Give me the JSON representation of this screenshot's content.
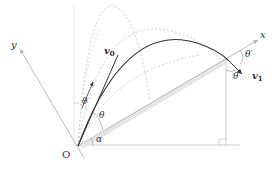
{
  "diagram": {
    "labels": {
      "origin": "O",
      "x_axis": "x",
      "y_axis": "y",
      "v0": "v",
      "v0_sub": "0",
      "v1": "v",
      "v1_sub": "1",
      "theta_left": "θ",
      "theta_inner": "θ",
      "theta_prime_top": "θ′",
      "theta_prime_bottom": "θ′",
      "alpha": "α"
    },
    "colors": {
      "trajectory": "#333333",
      "dashed_trajectories": "#c8c8c8",
      "axes": "#b4b4b4",
      "incline_shade": "#e6e6e6",
      "text": "#333333"
    }
  }
}
